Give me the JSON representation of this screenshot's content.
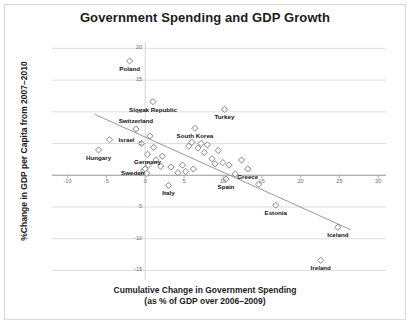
{
  "chart_data": {
    "type": "scatter",
    "title": "Government Spending and GDP Growth",
    "xlabel_line1": "Cumulative Change in Government Spending",
    "xlabel_line2": "(as % of GDP over 2006–2009)",
    "ylabel": "%Change in GDP per Capita from 2007–2010",
    "xlim": [
      -12,
      31
    ],
    "ylim": [
      -16.5,
      21
    ],
    "xticks": [
      -10,
      -5,
      0,
      5,
      10,
      15,
      20,
      25,
      30
    ],
    "xtick_labels": [
      "-10",
      "-5",
      "0",
      "5",
      "10",
      "15",
      "20",
      "25",
      "30"
    ],
    "yticks": [
      20,
      15,
      10,
      5,
      0,
      -5,
      -10,
      -15
    ],
    "ytick_labels": [
      "20",
      "15",
      "10",
      "5",
      "0",
      "-5",
      "-10",
      "-15"
    ],
    "grid": "horizontal",
    "legend": "none",
    "marker": "diamond-open",
    "marker_color": "#777777",
    "trendline": {
      "visible": true,
      "color": "#8c8c8c",
      "x0": -6.5,
      "y0": 9.6,
      "x1": 26.5,
      "y1": -8.6
    },
    "points": [
      {
        "label": "Poland",
        "x": -2.0,
        "y": 18.0,
        "label_pos": "below"
      },
      {
        "label": "Slovak Republic",
        "x": 1.0,
        "y": 11.6,
        "label_pos": "below"
      },
      {
        "label": "Turkey",
        "x": 10.2,
        "y": 10.4,
        "label_pos": "below"
      },
      {
        "label": "Switzerland",
        "x": -1.2,
        "y": 7.3,
        "label_pos": "above"
      },
      {
        "label": "South Korea",
        "x": 6.4,
        "y": 7.4,
        "label_pos": "below"
      },
      {
        "label": "Israel",
        "x": -4.6,
        "y": 5.6,
        "label_pos": "right"
      },
      {
        "label": "Hungary",
        "x": -6.0,
        "y": 4.0,
        "label_pos": "below"
      },
      {
        "label": "Germany",
        "x": 0.3,
        "y": 3.3,
        "label_pos": "below"
      },
      {
        "label": "Sweden",
        "x": 0.2,
        "y": 0.3,
        "label_pos": "left"
      },
      {
        "label": "Greece",
        "x": 13.2,
        "y": 1.0,
        "label_pos": "below"
      },
      {
        "label": "Spain",
        "x": 10.4,
        "y": -0.6,
        "label_pos": "below"
      },
      {
        "label": "Italy",
        "x": 3.0,
        "y": -1.6,
        "label_pos": "below"
      },
      {
        "label": "Estonia",
        "x": 16.8,
        "y": -4.7,
        "label_pos": "below"
      },
      {
        "label": "Iceland",
        "x": 24.8,
        "y": -8.2,
        "label_pos": "below"
      },
      {
        "label": "Ireland",
        "x": 22.6,
        "y": -13.4,
        "label_pos": "below"
      },
      {
        "label": "",
        "x": -0.5,
        "y": 5.0,
        "label_pos": ""
      },
      {
        "label": "",
        "x": 0.6,
        "y": 6.2,
        "label_pos": ""
      },
      {
        "label": "",
        "x": 1.1,
        "y": 4.4,
        "label_pos": ""
      },
      {
        "label": "",
        "x": 1.4,
        "y": 2.4,
        "label_pos": ""
      },
      {
        "label": "",
        "x": 2.0,
        "y": 1.4,
        "label_pos": ""
      },
      {
        "label": "",
        "x": 2.2,
        "y": 3.0,
        "label_pos": ""
      },
      {
        "label": "",
        "x": 0.4,
        "y": 1.6,
        "label_pos": ""
      },
      {
        "label": "",
        "x": -0.2,
        "y": 0.8,
        "label_pos": ""
      },
      {
        "label": "",
        "x": 0.0,
        "y": 1.0,
        "label_pos": ""
      },
      {
        "label": "",
        "x": 3.3,
        "y": 1.3,
        "label_pos": ""
      },
      {
        "label": "",
        "x": 4.2,
        "y": 0.4,
        "label_pos": ""
      },
      {
        "label": "",
        "x": 4.8,
        "y": 1.6,
        "label_pos": ""
      },
      {
        "label": "",
        "x": 5.6,
        "y": 4.6,
        "label_pos": ""
      },
      {
        "label": "",
        "x": 6.0,
        "y": 5.2,
        "label_pos": ""
      },
      {
        "label": "",
        "x": 6.8,
        "y": 4.3,
        "label_pos": ""
      },
      {
        "label": "",
        "x": 7.2,
        "y": 5.0,
        "label_pos": ""
      },
      {
        "label": "",
        "x": 7.6,
        "y": 3.6,
        "label_pos": ""
      },
      {
        "label": "",
        "x": 8.0,
        "y": 4.8,
        "label_pos": ""
      },
      {
        "label": "",
        "x": 8.6,
        "y": 2.6,
        "label_pos": ""
      },
      {
        "label": "",
        "x": 9.0,
        "y": 1.8,
        "label_pos": ""
      },
      {
        "label": "",
        "x": 9.4,
        "y": 3.9,
        "label_pos": ""
      },
      {
        "label": "",
        "x": 10.0,
        "y": 2.0,
        "label_pos": ""
      },
      {
        "label": "",
        "x": 10.8,
        "y": 1.6,
        "label_pos": ""
      },
      {
        "label": "",
        "x": 5.2,
        "y": 0.6,
        "label_pos": ""
      },
      {
        "label": "",
        "x": 6.2,
        "y": 1.0,
        "label_pos": ""
      },
      {
        "label": "",
        "x": 11.6,
        "y": 0.2,
        "label_pos": ""
      },
      {
        "label": "",
        "x": 12.4,
        "y": 2.4,
        "label_pos": ""
      },
      {
        "label": "",
        "x": 14.6,
        "y": -1.4,
        "label_pos": ""
      }
    ]
  }
}
